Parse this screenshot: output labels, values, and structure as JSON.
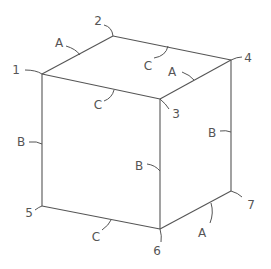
{
  "diagram": {
    "type": "isometric cube with labeled vertices and edge dimensions",
    "vertices": [
      {
        "id": "1",
        "label": "1",
        "x": 42,
        "y": 74,
        "lx": 16,
        "ly": 70
      },
      {
        "id": "2",
        "label": "2",
        "x": 113,
        "y": 36,
        "lx": 98,
        "ly": 21
      },
      {
        "id": "3",
        "label": "3",
        "x": 160,
        "y": 99,
        "lx": 176,
        "ly": 114
      },
      {
        "id": "4",
        "label": "4",
        "x": 231,
        "y": 60,
        "lx": 248,
        "ly": 58
      },
      {
        "id": "5",
        "label": "5",
        "x": 42,
        "y": 206,
        "lx": 29,
        "ly": 213
      },
      {
        "id": "6",
        "label": "6",
        "x": 160,
        "y": 229,
        "lx": 157,
        "ly": 251
      },
      {
        "id": "7",
        "label": "7",
        "x": 231,
        "y": 191,
        "lx": 251,
        "ly": 205
      }
    ],
    "edges": [
      {
        "from": "1",
        "to": "2",
        "label": "A"
      },
      {
        "from": "3",
        "to": "4",
        "label": "A"
      },
      {
        "from": "6",
        "to": "7",
        "label": "A"
      },
      {
        "from": "1",
        "to": "5",
        "label": "B"
      },
      {
        "from": "3",
        "to": "6",
        "label": "B"
      },
      {
        "from": "4",
        "to": "7",
        "label": "B"
      },
      {
        "from": "1",
        "to": "3",
        "label": "C"
      },
      {
        "from": "2",
        "to": "4",
        "label": "C"
      },
      {
        "from": "5",
        "to": "6",
        "label": "C"
      }
    ],
    "edge_labels": [
      {
        "text": "A",
        "x": 59,
        "y": 43
      },
      {
        "text": "A",
        "x": 172,
        "y": 72
      },
      {
        "text": "A",
        "x": 202,
        "y": 233
      },
      {
        "text": "B",
        "x": 21,
        "y": 142
      },
      {
        "text": "B",
        "x": 139,
        "y": 166
      },
      {
        "text": "B",
        "x": 212,
        "y": 133
      },
      {
        "text": "C",
        "x": 98,
        "y": 105
      },
      {
        "text": "C",
        "x": 148,
        "y": 66
      },
      {
        "text": "C",
        "x": 96,
        "y": 237
      }
    ]
  }
}
